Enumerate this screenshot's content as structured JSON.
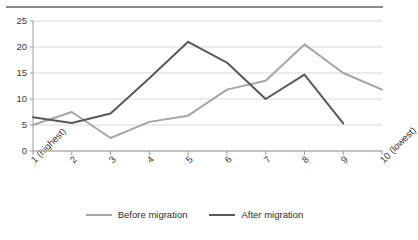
{
  "chart_data": {
    "type": "line",
    "title": "",
    "subtitle": "",
    "xlabel": "",
    "ylabel": "",
    "categories": [
      "1 (highest)",
      "2",
      "3",
      "4",
      "5",
      "6",
      "7",
      "8",
      "9",
      "10 (lowest)"
    ],
    "x": [
      1,
      2,
      3,
      4,
      5,
      6,
      7,
      8,
      9,
      10
    ],
    "series": [
      {
        "name": "Before migration",
        "color": "#a6a6a6",
        "values": [
          5,
          7.5,
          2.5,
          5.6,
          6.8,
          11.8,
          13.5,
          20.5,
          15,
          11.8
        ]
      },
      {
        "name": "After migration",
        "color": "#595959",
        "values": [
          6.5,
          5.4,
          7.2,
          14,
          21,
          17,
          10,
          14.7,
          5.3,
          null
        ]
      }
    ],
    "ylim": [
      0,
      25
    ],
    "yticks": [
      0,
      5,
      10,
      15,
      20,
      25
    ],
    "ytick_labels": [
      "0",
      "5",
      "10",
      "15",
      "20",
      "25"
    ],
    "xlim": [
      1,
      10
    ],
    "grid": true,
    "grid_axis": "y",
    "grid_color": "#d9d9d9",
    "axis_color": "#9a9a9a",
    "legend_position": "bottom",
    "legend_entries": [
      "Before migration",
      "After migration"
    ]
  },
  "legend": {
    "before": "Before migration",
    "after": "After migration"
  }
}
